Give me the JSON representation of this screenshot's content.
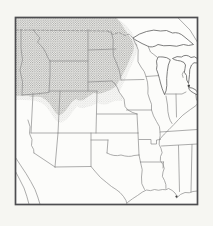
{
  "figure": {
    "kind": "scanned range map figure",
    "region_shown": "north-central United States with southern Canada border and northern Mexico edge",
    "shaded_range": "stippled distribution range over Pacific Northwest, northern Rockies and northern Great Plains (Idaho, Montana, Wyoming, North Dakota, South Dakota, fading into western Minnesota, northern Nebraska, northern Utah and northwest Colorado)"
  },
  "colors": {
    "page_bg": "#f6f6f2",
    "map_bg": "#fcfcfa",
    "frame": "#4d4d50",
    "state_line": "#8a8a8a",
    "river_line": "#8f8f8f",
    "lake_line": "#5d5d5d",
    "lake_fill": "#fdfdfc",
    "stipple_dot": "#8f8f8f",
    "range_tint": "#efefe9",
    "marker_fill": "#3d3d3d"
  },
  "map": {
    "width": 213,
    "height": 226,
    "frame": {
      "x": 15.5,
      "y": 17.5,
      "w": 182,
      "h": 187,
      "stroke_w": 1.7
    },
    "range": {
      "core": "M15.5 17.5 L116 17.5 Q121 22 124 28 Q128 34 132 40 Q135 46 133 52 Q130 58 128 64 Q125 70 122 76 Q119 82 115 87 Q110 91 105 92 Q99 95 94 93 Q89 96 85 99 Q80 102 76 99 Q72 101 69 106 Q66 111 62 114 Q58 117 55 112 Q52 107 49 103 Q45 99 41 97 Q36 96 32 97 Q27 95 22 96 L15.5 96 Z",
      "fringe": "M15.5 17.5 L116 17.5 Q126 24 130 30 Q136 38 138 46 Q137 54 133 62 Q129 70 126 78 Q122 86 119 93 Q124 97 122 101 Q115 100 110 103 Q104 106 98 103 Q92 106 87 107 Q81 110 77 106 Q74 110 71 114 Q68 119 63 122 Q58 124 54 118 Q50 112 46 106 Q41 102 36 101 Q30 100 24 100 L15.5 100 Z"
    },
    "boundaries": [
      {
        "name": "canada-border-49th-parallel",
        "d": "M15.8 30 L108 31",
        "dashed": true
      },
      {
        "name": "canada-border-minnesota",
        "d": "M108 31 L113 34.5 L119 32.5 L125 35.5 L129 34 L133 38",
        "dashed": true
      },
      {
        "name": "state-line-wa-or-idaho-west",
        "d": "M21 29.5 L21 48 L22.5 60 L20 70 L22.5 82 L22 95",
        "dashed": false
      },
      {
        "name": "state-line-idaho-montana",
        "d": "M33 29.5 L36.5 34 L40 38 L37.5 42 L43 48 L46 53 L47.5 57 L50 61",
        "dashed": false
      },
      {
        "name": "state-line-montana-south",
        "d": "M50 61 L88 61",
        "dashed": false
      },
      {
        "name": "state-line-idaho-wyoming",
        "d": "M50 61 L50 75 L49 92",
        "dashed": false
      },
      {
        "name": "state-line-idaho-south-42nd",
        "d": "M22 95 L35 94 L49 92.5",
        "dashed": false
      },
      {
        "name": "state-line-104th-meridian",
        "d": "M88 29.5 L88 91",
        "dashed": false
      },
      {
        "name": "state-line-nd-sd",
        "d": "M88 50 L116 49",
        "dashed": false
      },
      {
        "name": "state-line-sd-ne",
        "d": "M88 82 L112 81",
        "dashed": false
      },
      {
        "name": "river-missouri-nebraska",
        "d": "M112 81 Q116 84 117.5 88 Q118.5 92 122 96 Q125 99 124.5 103 Q124 107 128 110 Q131.5 112.5 137 114",
        "dashed": false
      },
      {
        "name": "state-line-wyoming-south",
        "d": "M49 91 L97 91",
        "dashed": false
      },
      {
        "name": "state-line-nv-ut",
        "d": "M33 93.5 L31 133",
        "dashed": false
      },
      {
        "name": "state-line-ut-co",
        "d": "M60 91 L58 133",
        "dashed": false
      },
      {
        "name": "state-line-co-east",
        "d": "M97 91 L96 133",
        "dashed": false
      },
      {
        "name": "state-line-37th-parallel",
        "d": "M31 133 L96 133 L138 133",
        "dashed": false
      },
      {
        "name": "state-line-nm-az",
        "d": "M58 133 L55 167",
        "dashed": false
      },
      {
        "name": "state-line-nm-tx-east",
        "d": "M91 133 L91 166",
        "dashed": false
      },
      {
        "name": "state-line-tx-panhandle-top",
        "d": "M91 140 L108 140",
        "dashed": false
      },
      {
        "name": "state-line-tx-panhandle-east",
        "d": "M108 140 L107 153",
        "dashed": false
      },
      {
        "name": "river-red-tx-ok",
        "d": "M107 153 Q114 157 121 155 Q129 157.5 134 155.5 L139 155",
        "dashed": false
      },
      {
        "name": "state-line-ok-east",
        "d": "M138 133 L139 155",
        "dashed": false
      },
      {
        "name": "state-line-tx-ar",
        "d": "M139 155 L140.5 162",
        "dashed": false
      },
      {
        "name": "state-line-la-ar",
        "d": "M140.5 162 L163.5 162",
        "dashed": false
      },
      {
        "name": "state-line-tx-la",
        "d": "M140.5 162 Q143.5 170 141.5 177 Q140.5 184 144.5 189.5",
        "dashed": false
      },
      {
        "name": "state-line-mo-ar-bootheel",
        "d": "M139 139.5 L151 139.5 L151 144 L156.5 144 L156.5 140 L160.5 139.5",
        "dashed": false
      },
      {
        "name": "state-line-ky-tn",
        "d": "M160 132 L197.4 129.5",
        "dashed": false
      },
      {
        "name": "state-line-tn-south",
        "d": "M161.5 146 L197.4 144",
        "dashed": false
      },
      {
        "name": "river-mississippi",
        "d": "M136 44 Q139.5 50 138 56 Q136.5 62 141 67 Q145 71.5 146 76.5 Q148 82 148 88 Q147 94 149.5 99 Q152.5 104 151.5 110 Q153 116 156.5 121.5 Q160.5 126.5 160 131.5 Q160.5 136 159.5 139.5 Q158 144.5 161 148.5 Q163.5 153 160.5 156.5 Q159 161 163 164.5 Q165.5 168.5 163 172 Q161 176.5 164.5 180.5 Q166.5 184.5 166 188.5",
        "dashed": false
      },
      {
        "name": "state-line-wi-il",
        "d": "M146 76.5 L160 75.5",
        "dashed": false
      },
      {
        "name": "state-line-mn-east",
        "d": "M133 38 L135.5 44 L136 44.5",
        "dashed": false
      },
      {
        "name": "state-line-mn-west",
        "d": "M111 31 Q114.5 40 113 48 Q112 56 116.5 63 Q119.5 70 120.5 76 L121 80",
        "dashed": false
      },
      {
        "name": "state-line-mn-ia",
        "d": "M121 80 L144 79.5",
        "dashed": false
      },
      {
        "name": "state-line-ia-mo",
        "d": "M126.5 110 L151.5 110",
        "dashed": false
      },
      {
        "name": "state-line-ne-ks",
        "d": "M97 114 L137 114",
        "dashed": false
      },
      {
        "name": "state-line-ks-mo",
        "d": "M137 114 L138 133",
        "dashed": false
      },
      {
        "name": "state-line-il-in",
        "d": "M166 96 L167.5 105 Q167.5 112 169 117 Q170 121 172 123.5",
        "dashed": false
      },
      {
        "name": "state-line-in-oh",
        "d": "M176 94 L176.5 117",
        "dashed": false
      },
      {
        "name": "river-ohio",
        "d": "M159.5 139.5 Q164.5 133.5 169 129.5 Q174 124.5 178.5 119.5 Q183 114.5 187 112 Q191 109 194 107 Q196.5 105.5 197.4 104",
        "dashed": false
      },
      {
        "name": "state-line-mi-south",
        "d": "M164.5 94 L182 94 L186 92",
        "dashed": false
      },
      {
        "name": "state-line-oh-east-hint",
        "d": "M195.5 92 L196.5 100",
        "dashed": false
      },
      {
        "name": "state-line-wi-mi-up",
        "d": "M148 46 L150.5 52 Q154 54.5 157 57",
        "dashed": false
      },
      {
        "name": "river-colorado-az-ca",
        "d": "M28 120 Q31.5 127 29.5 133.5 Q33.5 139.5 31.5 145.5 Q34.5 149.5 34 153",
        "dashed": false
      },
      {
        "name": "border-az-mexico",
        "d": "M34 153 L55 167",
        "dashed": false
      },
      {
        "name": "border-nm-mexico",
        "d": "M55 167 L91 166.5",
        "dashed": false
      },
      {
        "name": "river-rio-grande",
        "d": "M91 166.5 Q95.5 172 100.5 177.5 Q106.5 182.5 111.5 186.5 Q116.5 189.5 120 192.5 Q124 196.5 126 200.5 L127 204.3",
        "dashed": false
      },
      {
        "name": "coast-gulf-of-california-east",
        "d": "M15.8 158 Q21 166 26 173.5 Q31 181.5 35 189.5 Q38 197 40 204.2",
        "dashed": false
      },
      {
        "name": "coast-baja-california",
        "d": "M15.8 172 Q20 180 24 188 Q27 196 29 204.2",
        "dashed": false
      },
      {
        "name": "coast-gulf-of-mexico",
        "d": "M127.5 202.5 Q132.5 198.5 137.5 195.5 Q142.5 191.5 146.5 190 Q150.5 191.5 154.5 189.5 Q158.5 191 162.5 189.5 Q166.5 190.5 168.5 188.5 Q172.5 190 175 193 Q177.5 195.5 176.5 198 Q180.5 193.5 185 192.5 Q189.5 193.5 193 191.5 L197.4 191",
        "dashed": false
      },
      {
        "name": "state-line-ms-al",
        "d": "M178.5 145.5 L179.5 191.5",
        "dashed": false
      },
      {
        "name": "state-line-al-ga",
        "d": "M192 144.5 L191 192",
        "dashed": false
      },
      {
        "name": "state-line-la-ms",
        "d": "M163.5 162 L163 168",
        "dashed": false
      },
      {
        "name": "border-ontario-diagonal",
        "d": "M178 17.8 L190 30 L197.4 42",
        "dashed": false
      },
      {
        "name": "lake-shore-saginaw-bay",
        "d": "M183.5 71.5 Q181 74 183 77.5",
        "dashed": false
      }
    ],
    "lakes": [
      {
        "name": "lake-superior",
        "d": "M133 38 Q139 33.5 146.5 31.5 Q154 29 160.5 31 Q166.5 29 172.5 33 Q178.5 31.5 184 36.5 Q189 40.5 193.5 44.5 Q188.5 46.5 183.5 44.5 Q176.5 47.5 170 45.5 Q163.5 46.5 158 44.5 Q152 48.5 147.5 46 Q141.5 43.5 137.5 41 Q134.5 39.5 133 38 Z"
      },
      {
        "name": "lake-michigan",
        "d": "M158 57 Q155.5 61 157 65.5 Q155.5 69 158 73.5 Q159.5 78.5 160.5 83 Q162 89 164.5 94.5 Q166.5 91.5 166.8 85.5 Q166.3 78.5 167.3 71.5 Q167.8 64.5 170.3 59.8 Q166.8 57 163 57 Q160 56.8 158 57 Z"
      },
      {
        "name": "lake-huron",
        "d": "M172.5 58.5 Q177 55.5 181.5 57 Q186 53.5 191 57.5 Q194.5 55.5 197.4 58.5 L197.4 63 Q193.5 61.5 191.5 65 Q189 69.5 189.5 74.5 Q189 79.5 188.5 83.5 Q186 80.5 186.5 75.5 Q183 72.5 185 68.5 Q186.5 64.5 184 62.5 Q180.5 60.5 177.5 60.5 Q174.5 60 172.5 58.5 Z"
      },
      {
        "name": "lake-erie",
        "d": "M188.5 87.5 Q192.5 87.5 195 89.5 Q196.5 90.5 197.4 92 L197.4 95 Q193.5 93 190.5 91 Q189 89.5 188.5 87.5 Z"
      }
    ],
    "markers": [
      {
        "name": "lake-st-clair",
        "cx": 188.8,
        "cy": 85.8,
        "r": 1.2
      },
      {
        "name": "mississippi-river-delta",
        "cx": 176.5,
        "cy": 196.5,
        "r": 1.1
      }
    ]
  }
}
